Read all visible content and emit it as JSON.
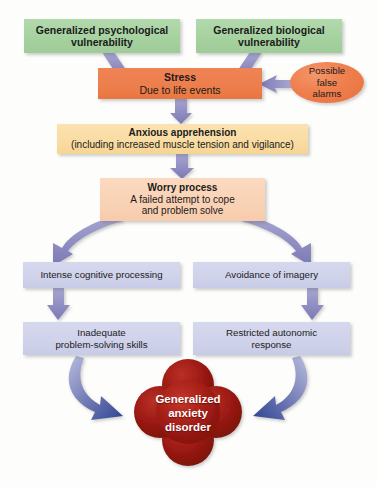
{
  "figure": {
    "background_color": "#fdfdfc"
  },
  "palette": {
    "green": "#a6d2a0",
    "orange": "#ed7f4e",
    "peach": "#f9d2b5",
    "sand": "#f9dca3",
    "lavender": "#cfd2ea",
    "arrow_purple": "#8d8cc0",
    "arrow_blue": "#3a4f9b",
    "clover_red": "#a81f17",
    "text_dark": "#1b1b1b",
    "text_light": "#ffffff"
  },
  "nodes": {
    "psych_vulnerability": {
      "title": "Generalized psychological",
      "subtitle": "vulnerability"
    },
    "bio_vulnerability": {
      "title": "Generalized biological",
      "subtitle": "vulnerability"
    },
    "stress": {
      "title": "Stress",
      "subtitle": "Due to life events"
    },
    "false_alarms": {
      "line1": "Possible",
      "line2": "false",
      "line3": "alarms"
    },
    "anxious_apprehension": {
      "title": "Anxious apprehension",
      "subtitle": "(including increased muscle tension and vigilance)"
    },
    "worry_process": {
      "title": "Worry process",
      "subtitle_line1": "A failed attempt to cope",
      "subtitle_line2": "and problem solve"
    },
    "intense_cognitive": {
      "title": "Intense cognitive processing"
    },
    "avoidance_imagery": {
      "title": "Avoidance of imagery"
    },
    "inadequate_problem_solving": {
      "line1": "Inadequate",
      "line2": "problem-solving skills"
    },
    "restricted_autonomic": {
      "line1": "Restricted autonomic",
      "line2": "response"
    },
    "outcome": {
      "line1": "Generalized",
      "line2": "anxiety",
      "line3": "disorder"
    }
  },
  "connectors": [
    {
      "name": "psych-vulnerability-to-stress",
      "from": "psych_vulnerability",
      "to": "stress",
      "style": "straight-arrow",
      "color": "#8d8cc0"
    },
    {
      "name": "bio-vulnerability-to-stress",
      "from": "bio_vulnerability",
      "to": "stress",
      "style": "straight-arrow",
      "color": "#8d8cc0"
    },
    {
      "name": "false-alarms-to-stress",
      "from": "false_alarms",
      "to": "stress",
      "style": "straight-arrow",
      "color": "#8d8cc0"
    },
    {
      "name": "stress-to-anxious-apprehension",
      "from": "stress",
      "to": "anxious_apprehension",
      "style": "straight-arrow",
      "color": "#8d8cc0"
    },
    {
      "name": "anxious-apprehension-to-worry-process",
      "from": "anxious_apprehension",
      "to": "worry_process",
      "style": "straight-arrow",
      "color": "#8d8cc0"
    },
    {
      "name": "worry-process-to-intense-cognitive",
      "from": "worry_process",
      "to": "intense_cognitive",
      "style": "curved-arrow",
      "color": "#8d8cc0"
    },
    {
      "name": "worry-process-to-avoidance-imagery",
      "from": "worry_process",
      "to": "avoidance_imagery",
      "style": "curved-arrow",
      "color": "#8d8cc0"
    },
    {
      "name": "intense-cognitive-to-inadequate-problem-solving",
      "from": "intense_cognitive",
      "to": "inadequate_problem_solving",
      "style": "straight-arrow",
      "color": "#8d8cc0"
    },
    {
      "name": "avoidance-imagery-to-restricted-autonomic",
      "from": "avoidance_imagery",
      "to": "restricted_autonomic",
      "style": "straight-arrow",
      "color": "#8d8cc0"
    },
    {
      "name": "inadequate-problem-solving-to-outcome",
      "from": "inadequate_problem_solving",
      "to": "outcome",
      "style": "curved-arrow",
      "color": "#3a4f9b"
    },
    {
      "name": "restricted-autonomic-to-outcome",
      "from": "restricted_autonomic",
      "to": "outcome",
      "style": "curved-arrow",
      "color": "#3a4f9b"
    }
  ]
}
